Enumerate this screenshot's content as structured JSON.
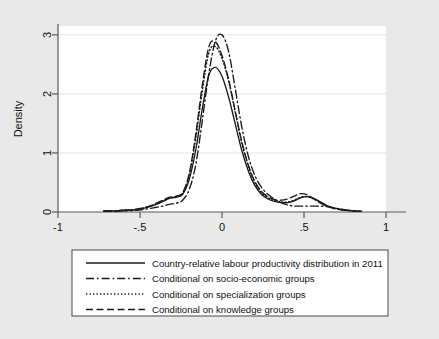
{
  "figure": {
    "background_color": "#e9e9e9",
    "plot_background_color": "#ffffff",
    "axis_color": "#5a5a5a",
    "grid_color": "#e4e4e4",
    "curve_color": "#1a1a1a"
  },
  "axes": {
    "ylabel": "Density",
    "xlabel": "",
    "x_ticks": [
      "-1",
      "-.5",
      "0",
      ".5",
      "1"
    ],
    "y_ticks": [
      "0",
      "1",
      "2",
      "3"
    ]
  },
  "legend": {
    "entries": [
      {
        "label": "Country-relative labour productivity distribution in 2011",
        "style": "solid"
      },
      {
        "label": "Conditional on socio-economic groups",
        "style": "dashdot"
      },
      {
        "label": "Conditional on specialization groups",
        "style": "dotted"
      },
      {
        "label": "Conditional on knowledge groups",
        "style": "dashed"
      }
    ]
  },
  "chart_data": {
    "type": "line",
    "title": "",
    "xlabel": "",
    "ylabel": "Density",
    "xlim": [
      -1,
      1
    ],
    "ylim": [
      0,
      3.15
    ],
    "x_ticks": [
      -1,
      -0.5,
      0,
      0.5,
      1
    ],
    "y_ticks": [
      0,
      1,
      2,
      3
    ],
    "grid": "horizontal",
    "legend_position": "below-plot",
    "series": [
      {
        "name": "Country-relative labour productivity distribution in 2011",
        "style": "solid",
        "x": [
          -0.72,
          -0.68,
          -0.64,
          -0.6,
          -0.56,
          -0.52,
          -0.48,
          -0.44,
          -0.4,
          -0.36,
          -0.32,
          -0.28,
          -0.24,
          -0.2,
          -0.16,
          -0.12,
          -0.08,
          -0.04,
          0.0,
          0.04,
          0.08,
          0.12,
          0.16,
          0.2,
          0.24,
          0.28,
          0.32,
          0.36,
          0.4,
          0.44,
          0.48,
          0.52,
          0.56,
          0.6,
          0.64,
          0.68,
          0.72,
          0.76,
          0.8,
          0.85
        ],
        "y": [
          0.02,
          0.02,
          0.02,
          0.03,
          0.03,
          0.04,
          0.06,
          0.09,
          0.13,
          0.18,
          0.23,
          0.25,
          0.3,
          0.55,
          1.05,
          1.75,
          2.32,
          2.45,
          2.3,
          1.95,
          1.5,
          1.05,
          0.7,
          0.45,
          0.3,
          0.22,
          0.18,
          0.16,
          0.16,
          0.19,
          0.24,
          0.26,
          0.23,
          0.17,
          0.11,
          0.07,
          0.05,
          0.03,
          0.02,
          0.01
        ]
      },
      {
        "name": "Conditional on socio-economic groups",
        "style": "dashdot",
        "x": [
          -0.72,
          -0.68,
          -0.64,
          -0.6,
          -0.56,
          -0.52,
          -0.48,
          -0.44,
          -0.4,
          -0.36,
          -0.32,
          -0.28,
          -0.24,
          -0.2,
          -0.16,
          -0.12,
          -0.08,
          -0.04,
          0.0,
          0.04,
          0.08,
          0.12,
          0.16,
          0.2,
          0.24,
          0.28,
          0.32,
          0.36,
          0.4,
          0.44,
          0.48,
          0.52,
          0.56,
          0.6,
          0.64,
          0.68,
          0.72,
          0.76,
          0.8,
          0.85
        ],
        "y": [
          0.01,
          0.01,
          0.01,
          0.02,
          0.02,
          0.03,
          0.04,
          0.06,
          0.08,
          0.1,
          0.13,
          0.15,
          0.2,
          0.38,
          0.8,
          1.55,
          2.35,
          2.9,
          3.0,
          2.72,
          2.1,
          1.45,
          0.95,
          0.62,
          0.42,
          0.3,
          0.22,
          0.16,
          0.12,
          0.1,
          0.1,
          0.1,
          0.1,
          0.1,
          0.09,
          0.07,
          0.05,
          0.03,
          0.02,
          0.01
        ]
      },
      {
        "name": "Conditional on specialization groups",
        "style": "dotted",
        "x": [
          -0.72,
          -0.68,
          -0.64,
          -0.6,
          -0.56,
          -0.52,
          -0.48,
          -0.44,
          -0.4,
          -0.36,
          -0.32,
          -0.28,
          -0.24,
          -0.2,
          -0.16,
          -0.12,
          -0.08,
          -0.04,
          0.0,
          0.04,
          0.08,
          0.12,
          0.16,
          0.2,
          0.24,
          0.28,
          0.32,
          0.36,
          0.4,
          0.44,
          0.48,
          0.52,
          0.56,
          0.6,
          0.64,
          0.68,
          0.72,
          0.76,
          0.8,
          0.85
        ],
        "y": [
          0.02,
          0.02,
          0.02,
          0.03,
          0.03,
          0.05,
          0.07,
          0.1,
          0.14,
          0.19,
          0.24,
          0.26,
          0.32,
          0.62,
          1.25,
          2.05,
          2.7,
          2.8,
          2.6,
          2.22,
          1.7,
          1.18,
          0.78,
          0.5,
          0.33,
          0.24,
          0.19,
          0.17,
          0.17,
          0.2,
          0.25,
          0.26,
          0.22,
          0.16,
          0.1,
          0.07,
          0.04,
          0.03,
          0.02,
          0.01
        ]
      },
      {
        "name": "Conditional on knowledge groups",
        "style": "dashed",
        "x": [
          -0.72,
          -0.68,
          -0.64,
          -0.6,
          -0.56,
          -0.52,
          -0.48,
          -0.44,
          -0.4,
          -0.36,
          -0.32,
          -0.28,
          -0.24,
          -0.2,
          -0.16,
          -0.12,
          -0.08,
          -0.04,
          0.0,
          0.04,
          0.08,
          0.12,
          0.16,
          0.2,
          0.24,
          0.28,
          0.32,
          0.36,
          0.4,
          0.44,
          0.48,
          0.52,
          0.56,
          0.6,
          0.64,
          0.68,
          0.72,
          0.76,
          0.8,
          0.85
        ],
        "y": [
          0.02,
          0.02,
          0.02,
          0.03,
          0.03,
          0.05,
          0.07,
          0.1,
          0.15,
          0.2,
          0.25,
          0.27,
          0.33,
          0.65,
          1.32,
          2.15,
          2.8,
          2.88,
          2.65,
          2.25,
          1.72,
          1.2,
          0.8,
          0.52,
          0.35,
          0.26,
          0.21,
          0.2,
          0.22,
          0.27,
          0.31,
          0.29,
          0.22,
          0.15,
          0.1,
          0.06,
          0.04,
          0.03,
          0.02,
          0.01
        ]
      }
    ]
  }
}
